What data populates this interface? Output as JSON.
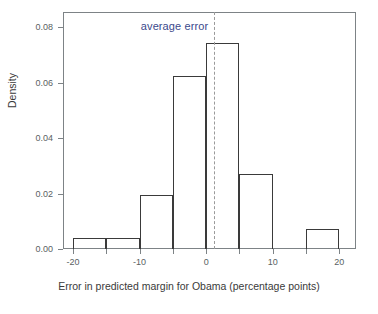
{
  "chart_data": {
    "type": "bar",
    "title": "",
    "subtitle": "",
    "xlabel": "Error in predicted margin for Obama (percentage points)",
    "ylabel": "Density",
    "xlim": [
      -21.5,
      22.5
    ],
    "ylim": [
      0.0,
      0.0855
    ],
    "grid": false,
    "legend": "none",
    "bin_width": 5,
    "categories": [
      "-20 to -15",
      "-15 to -10",
      "-10 to -5",
      "-5 to 0",
      "0 to 5",
      "5 to 10",
      "10 to 15",
      "15 to 20"
    ],
    "bin_starts": [
      -20,
      -15,
      -10,
      -5,
      0,
      5,
      10,
      15
    ],
    "bin_ends": [
      -15,
      -10,
      -5,
      0,
      5,
      10,
      15,
      20
    ],
    "values": [
      0.004,
      0.004,
      0.0195,
      0.0625,
      0.0745,
      0.027,
      0.0,
      0.0072
    ],
    "xticks": [
      -20,
      -15,
      -10,
      -5,
      0,
      5,
      10,
      15,
      20
    ],
    "xtick_labels": [
      "-20",
      "",
      "-10",
      "",
      "0",
      "",
      "10",
      "",
      "20"
    ],
    "yticks": [
      0.0,
      0.02,
      0.04,
      0.06,
      0.08
    ],
    "ytick_labels": [
      "0.00",
      "0.02",
      "0.04",
      "0.06",
      "0.08"
    ],
    "annotations": [
      {
        "name": "average-error",
        "label": "average error",
        "x_value": 1.2,
        "style": "dashed vertical line"
      }
    ],
    "colors": {
      "bar_edge": "#3a3a3a",
      "bar_fill": "none",
      "axis": "#7d8386",
      "annotation_text": "#3b4a8c",
      "annotation_line": "#9a9a9a",
      "tick_text": "#5a5f63",
      "axis_title": "#3a3a3a",
      "background": "#ffffff"
    }
  }
}
